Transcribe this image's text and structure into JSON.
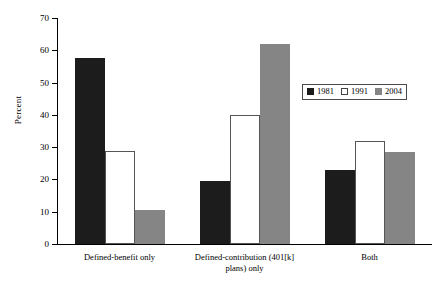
{
  "chart_data": {
    "type": "bar",
    "title": "",
    "xlabel": "",
    "ylabel": "Percent",
    "ylim": [
      0,
      70
    ],
    "yticks": [
      0,
      10,
      20,
      30,
      40,
      50,
      60,
      70
    ],
    "grid": false,
    "legend_position": "top-right",
    "categories": [
      "Defined-benefit only",
      "Defined-contribution (401[k]\nplans) only",
      "Both"
    ],
    "series": [
      {
        "name": "1981",
        "color": "#1c1c1c",
        "values": [
          57.5,
          19.5,
          23.0
        ]
      },
      {
        "name": "1991",
        "color": "#ffffff",
        "values": [
          28.8,
          40.0,
          31.8
        ]
      },
      {
        "name": "2004",
        "color": "#858585",
        "values": [
          10.5,
          62.0,
          28.5
        ]
      }
    ]
  },
  "legend": {
    "entries": [
      {
        "label": "1981"
      },
      {
        "label": "1991"
      },
      {
        "label": "2004"
      }
    ]
  },
  "axis": {
    "y_title": "Percent",
    "y_tick_labels": [
      "70",
      "60",
      "50",
      "40",
      "30",
      "20",
      "10",
      "0"
    ]
  },
  "x_axis": {
    "labels": [
      "Defined-benefit only",
      "Defined-contribution (401[k]\nplans) only",
      "Both"
    ]
  },
  "colors": {
    "series_1981": "#1c1c1c",
    "series_1991": "#ffffff",
    "series_2004": "#858585",
    "axis": "#000000",
    "background": "#ffffff"
  }
}
